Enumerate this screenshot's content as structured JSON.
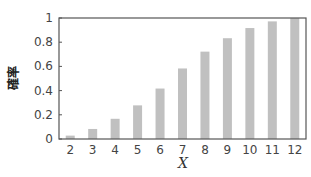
{
  "chart_data": {
    "type": "bar",
    "title": "",
    "xlabel": "X",
    "ylabel": "確率",
    "categories": [
      "2",
      "3",
      "4",
      "5",
      "6",
      "7",
      "8",
      "9",
      "10",
      "11",
      "12"
    ],
    "values": [
      0.028,
      0.083,
      0.167,
      0.278,
      0.417,
      0.583,
      0.722,
      0.833,
      0.917,
      0.972,
      1.0
    ],
    "ylim": [
      0,
      1
    ],
    "yticks": [
      "0",
      "0.2",
      "0.4",
      "0.6",
      "0.8",
      "1"
    ],
    "bar_color": "#c0c0c0",
    "grid": false,
    "legend": null
  }
}
